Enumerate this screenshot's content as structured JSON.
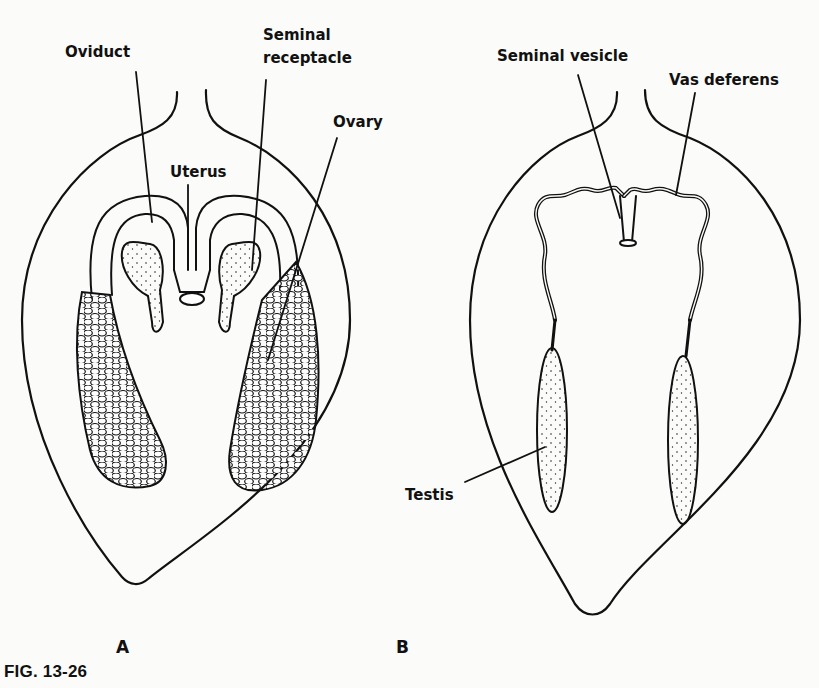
{
  "figure": {
    "caption": "FIG. 13-26",
    "panels": [
      {
        "id": "A",
        "letter": "A",
        "labels": {
          "oviduct": "Oviduct",
          "seminal_receptacle_line1": "Seminal",
          "seminal_receptacle_line2": "receptacle",
          "ovary": "Ovary",
          "uterus": "Uterus"
        }
      },
      {
        "id": "B",
        "letter": "B",
        "labels": {
          "seminal_vesicle": "Seminal vesicle",
          "vas_deferens": "Vas deferens",
          "testis": "Testis"
        }
      }
    ]
  },
  "colors": {
    "ink": "#111111",
    "paper": "#fbfbf9"
  }
}
